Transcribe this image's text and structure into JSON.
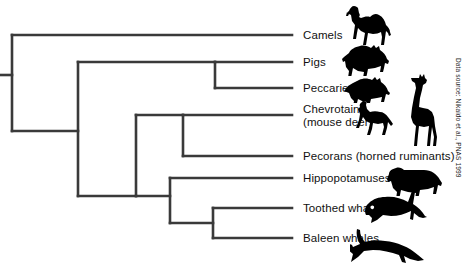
{
  "figure": {
    "type": "cladogram",
    "credit": "Data source: Nikaido et al., PNAS 1999",
    "line_color": "#3a3a3a",
    "silhouette_color": "#000000"
  },
  "taxa": [
    {
      "id": "camels",
      "label": "Camels",
      "label2": "",
      "tip_y": 35,
      "branch_start_x": 12,
      "silhouette": "camel-silhouette"
    },
    {
      "id": "pigs",
      "label": "Pigs",
      "label2": "",
      "tip_y": 62,
      "branch_start_x": 215,
      "silhouette": "pig-silhouette"
    },
    {
      "id": "peccaries",
      "label": "Peccaries",
      "label2": "",
      "tip_y": 88,
      "branch_start_x": 215,
      "silhouette": "peccary-silhouette"
    },
    {
      "id": "chevrotains",
      "label": "Chevrotains",
      "label2": "(mouse deer)",
      "tip_y": 115,
      "branch_start_x": 183,
      "silhouette": "chevrotain-silhouette"
    },
    {
      "id": "pecorans",
      "label": "Pecorans (horned ruminants)",
      "label2": "",
      "tip_y": 156,
      "branch_start_x": 183,
      "silhouette": "giraffe-silhouette"
    },
    {
      "id": "hippos",
      "label": "Hippopotamuses",
      "label2": "",
      "tip_y": 178,
      "branch_start_x": 170,
      "silhouette": "hippopotamus-silhouette"
    },
    {
      "id": "toothed",
      "label": "Toothed whales",
      "label2": "",
      "tip_y": 208,
      "branch_start_x": 213,
      "silhouette": "orca-silhouette"
    },
    {
      "id": "baleen",
      "label": "Baleen whales",
      "label2": "",
      "tip_y": 238,
      "branch_start_x": 213,
      "silhouette": "baleen-whale-silhouette"
    }
  ],
  "nodes": [
    {
      "id": "root",
      "x": 12,
      "y_top": 35,
      "y_bottom": 131,
      "stem_from_x": 0,
      "stem_y": 75
    },
    {
      "id": "artiodactyl-core",
      "x": 78,
      "y_top": 62,
      "y_bottom": 196,
      "stem_from_x": 12,
      "stem_y": 131
    },
    {
      "id": "suina",
      "x": 215,
      "y_top": 62,
      "y_bottom": 88,
      "stem_from_x": 78,
      "stem_y": 75
    },
    {
      "id": "ruminant-whale",
      "x": 136,
      "y_top": 115,
      "y_bottom": 178,
      "stem_from_x": 78,
      "stem_y": 196
    },
    {
      "id": "ruminantia",
      "x": 183,
      "y_top": 115,
      "y_bottom": 156,
      "stem_from_x": 136,
      "stem_y": 115
    },
    {
      "id": "whippomorpha",
      "x": 170,
      "y_top": 178,
      "y_bottom": 223,
      "stem_from_x": 136,
      "stem_y": 178
    },
    {
      "id": "cetacea",
      "x": 213,
      "y_top": 208,
      "y_bottom": 238,
      "stem_from_x": 170,
      "stem_y": 223
    }
  ]
}
